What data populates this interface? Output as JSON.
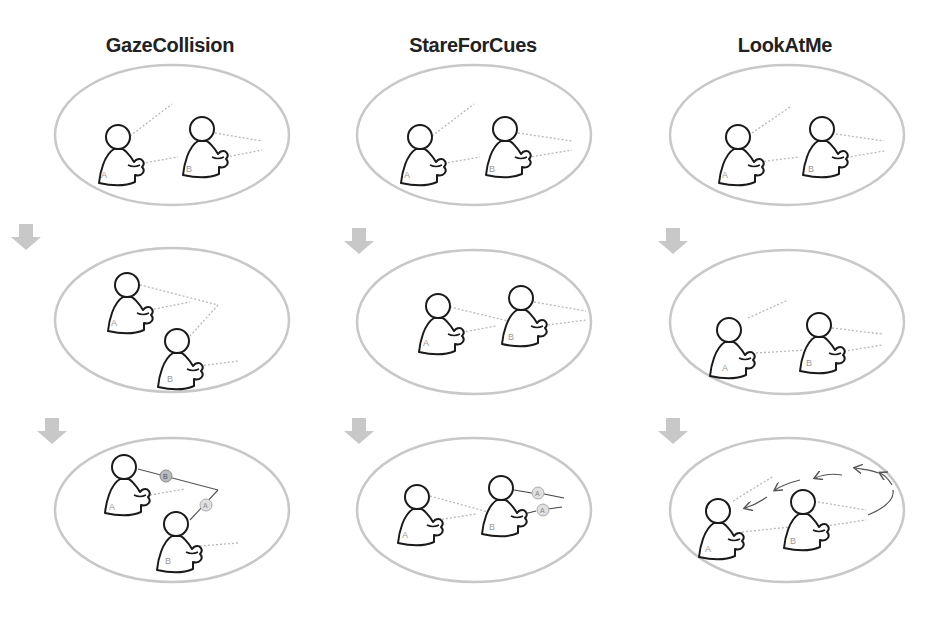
{
  "columns": [
    {
      "title": "GazeCollision"
    },
    {
      "title": "StareForCues"
    },
    {
      "title": "LookAtMe"
    }
  ],
  "labels": {
    "person_a": "A",
    "person_b": "B",
    "token_a": "A",
    "token_b": "B"
  },
  "icons": [
    "down-arrow-icon",
    "person-icon",
    "gaze-line",
    "gaze-token-icon",
    "curved-arrow-icon"
  ],
  "colors": {
    "ellipse_stroke": "#c8c8c8",
    "figure_stroke": "#1a1a1a",
    "gaze_line": "#b0b0b0",
    "arrow_fill": "#c4c4c4",
    "token_fill": "#d8d8d8"
  }
}
